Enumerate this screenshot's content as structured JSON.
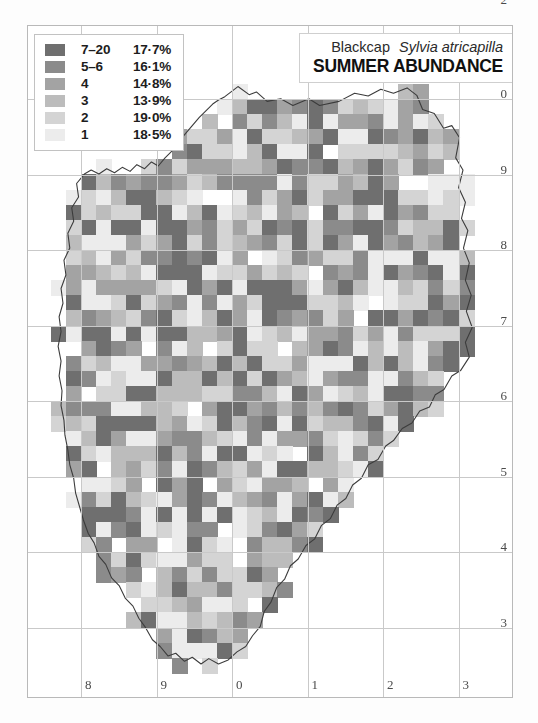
{
  "figure": {
    "domain": "distribution-map",
    "background_color": "#ffffff",
    "frame_color": "#b9b9b9",
    "gridline_color": "#c9c9c9"
  },
  "title": {
    "common_name": "Blackcap",
    "scientific_name": "Sylvia atricapilla",
    "subtitle": "SUMMER ABUNDANCE"
  },
  "legend": {
    "classes": [
      {
        "label": "7–20",
        "percent": "17·7%",
        "color": "#6f6f6f"
      },
      {
        "label": "5–6",
        "percent": "16·1%",
        "color": "#8b8b8b"
      },
      {
        "label": "4",
        "percent": "14·8%",
        "color": "#a3a3a3"
      },
      {
        "label": "3",
        "percent": "13·9%",
        "color": "#bcbcbc"
      },
      {
        "label": "2",
        "percent": "19·0%",
        "color": "#d4d4d4"
      },
      {
        "label": "1",
        "percent": "18·5%",
        "color": "#ececec"
      }
    ]
  },
  "axes": {
    "right_labels": [
      "0",
      "9",
      "8",
      "7",
      "6",
      "5",
      "4",
      "3",
      "2"
    ],
    "bottom_labels": [
      "8",
      "9",
      "0",
      "1",
      "2",
      "3"
    ]
  },
  "chart_data": {
    "type": "heatmap",
    "xlabel": "",
    "ylabel": "",
    "grid": true,
    "legend_position": "top-left",
    "cell_size_px": 15.1,
    "grid_cells_per_graticule": 5,
    "value_scale": [
      {
        "class": 1,
        "count_label": "1",
        "share_percent": 18.5,
        "color": "#ececec"
      },
      {
        "class": 2,
        "count_label": "2",
        "share_percent": 19.0,
        "color": "#d4d4d4"
      },
      {
        "class": 3,
        "count_label": "3",
        "share_percent": 13.9,
        "color": "#bcbcbc"
      },
      {
        "class": 4,
        "count_label": "4",
        "share_percent": 14.8,
        "color": "#a3a3a3"
      },
      {
        "class": 5,
        "count_label": "5–6",
        "share_percent": 16.1,
        "color": "#8b8b8b"
      },
      {
        "class": 6,
        "count_label": "7–20",
        "share_percent": 17.7,
        "color": "#6f6f6f"
      }
    ],
    "columns": 32,
    "rows": 45,
    "seed": 20240517,
    "occupancy": 0.97,
    "region_outline_color": "#3c3c3c"
  }
}
